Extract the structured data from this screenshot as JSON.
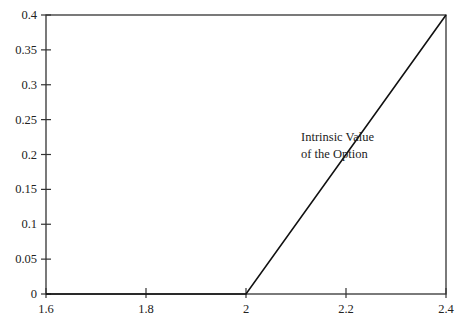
{
  "chart_data": {
    "type": "line",
    "title": "",
    "xlabel": "",
    "ylabel": "",
    "xlim": [
      1.6,
      2.4
    ],
    "ylim": [
      0,
      0.4
    ],
    "grid": false,
    "legend": null,
    "x_ticks": [
      "1.6",
      "1.8",
      "2",
      "2.2",
      "2.4"
    ],
    "y_ticks": [
      "0",
      "0.05",
      "0.1",
      "0.15",
      "0.2",
      "0.25",
      "0.3",
      "0.35",
      "0.4"
    ],
    "series": [
      {
        "name": "Intrinsic Value of the Option",
        "x": [
          1.6,
          2.0,
          2.4
        ],
        "y": [
          0,
          0,
          0.4
        ]
      }
    ],
    "annotations": [
      {
        "text_line1": "Intrinsic Value",
        "text_line2": "of the Option",
        "x": 2.13,
        "y": 0.2
      }
    ]
  }
}
